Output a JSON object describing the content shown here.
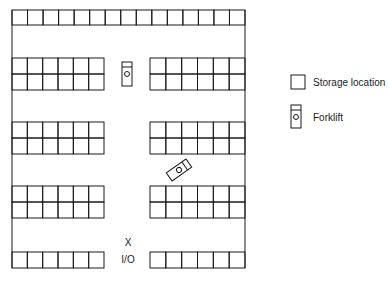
{
  "diagram": {
    "io_marker": "X",
    "io_label": "I/O",
    "line_color": "#1a1a1a",
    "layout": {
      "top_row": {
        "cells": 15,
        "rows": 1
      },
      "left_blocks": [
        {
          "cols": 6,
          "rows": 2
        },
        {
          "cols": 6,
          "rows": 2
        },
        {
          "cols": 6,
          "rows": 2
        },
        {
          "cols": 6,
          "rows": 1
        }
      ],
      "right_blocks": [
        {
          "cols": 6,
          "rows": 2
        },
        {
          "cols": 6,
          "rows": 2
        },
        {
          "cols": 6,
          "rows": 2
        },
        {
          "cols": 6,
          "rows": 1
        }
      ],
      "forklifts": [
        {
          "orientation": "vertical"
        },
        {
          "orientation": "diagonal"
        }
      ]
    }
  },
  "legend": {
    "items": [
      {
        "icon": "storage-location-icon",
        "label": "Storage location"
      },
      {
        "icon": "forklift-icon",
        "label": "Forklift"
      }
    ]
  }
}
